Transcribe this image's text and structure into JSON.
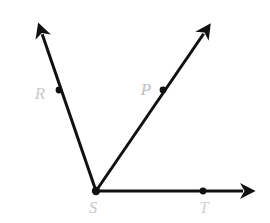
{
  "figure": {
    "background_color": "#ffffff",
    "stroke_color": "#111111",
    "stroke_width": 3,
    "width": 270,
    "height": 223
  },
  "vertex": {
    "name": "S",
    "label": "S",
    "label_color": "#c9c9c9",
    "x": 96,
    "y": 191,
    "label_x": 93,
    "label_y": 213
  },
  "points": [
    {
      "name": "R",
      "label": "R",
      "label_color": "#c9c9c9",
      "dot_x": 59,
      "dot_y": 90,
      "dot_r": 3.4,
      "label_x": 40,
      "label_y": 99
    },
    {
      "name": "P",
      "label": "P",
      "label_color": "#bdbdbd",
      "dot_x": 163,
      "dot_y": 90,
      "dot_r": 3.4,
      "label_x": 146,
      "label_y": 95
    },
    {
      "name": "T",
      "label": "T",
      "label_color": "#d2d2d2",
      "dot_x": 203,
      "dot_y": 191,
      "dot_r": 3.4,
      "label_x": 204,
      "label_y": 213
    }
  ],
  "rays": [
    {
      "name": "ray-SR",
      "label": "ray SR",
      "from_x": 96,
      "from_y": 191,
      "to_x": 38,
      "to_y": 22,
      "has_arrow": true
    },
    {
      "name": "ray-SP",
      "label": "ray SP",
      "from_x": 96,
      "from_y": 191,
      "to_x": 211,
      "to_y": 23,
      "has_arrow": true
    },
    {
      "name": "ray-ST",
      "label": "ray ST",
      "from_x": 96,
      "from_y": 191,
      "to_x": 256,
      "to_y": 191,
      "has_arrow": true
    }
  ],
  "vertex_dot": {
    "name": "vertex-dot-S",
    "x": 96,
    "y": 191,
    "r": 4.2
  }
}
